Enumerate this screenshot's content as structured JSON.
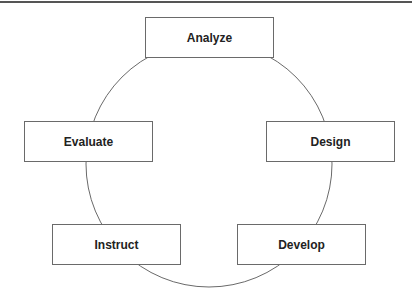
{
  "diagram": {
    "type": "cycle",
    "colors": {
      "line": "#6a6a6a",
      "text": "#222222",
      "background": "#ffffff",
      "top_rule": "#555555"
    },
    "circle": {
      "cx": 209,
      "cy": 164,
      "r": 123
    },
    "stages": [
      {
        "id": "analyze",
        "label": "Analyze",
        "x": 145,
        "y": 17
      },
      {
        "id": "design",
        "label": "Design",
        "x": 266,
        "y": 121
      },
      {
        "id": "develop",
        "label": "Develop",
        "x": 237,
        "y": 224
      },
      {
        "id": "instruct",
        "label": "Instruct",
        "x": 52,
        "y": 224
      },
      {
        "id": "evaluate",
        "label": "Evaluate",
        "x": 24,
        "y": 121
      }
    ]
  }
}
